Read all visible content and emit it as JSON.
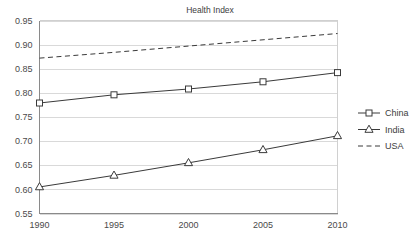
{
  "chart_data": {
    "type": "line",
    "title": "Health Index",
    "xlabel": "",
    "ylabel": "",
    "x": [
      1990,
      1995,
      2000,
      2005,
      2010
    ],
    "categories": [
      "1990",
      "1995",
      "2000",
      "2005",
      "2010"
    ],
    "xtick_labels": [
      "1990",
      "1995",
      "2000",
      "2005",
      "2010"
    ],
    "ytick_labels": [
      "0.55",
      "0.60",
      "0.65",
      "0.70",
      "0.75",
      "0.80",
      "0.85",
      "0.90",
      "0.95"
    ],
    "ytick_values": [
      0.55,
      0.6,
      0.65,
      0.7,
      0.75,
      0.8,
      0.85,
      0.9,
      0.95
    ],
    "ylim": [
      0.55,
      0.95
    ],
    "xlim": [
      1990,
      2010
    ],
    "grid": "horizontal",
    "legend_position": "right",
    "series": [
      {
        "name": "China",
        "values": [
          0.779,
          0.796,
          0.808,
          0.823,
          0.842
        ],
        "marker": "square",
        "line_style": "solid",
        "color": "#3a3a3a"
      },
      {
        "name": "India",
        "values": [
          0.605,
          0.629,
          0.655,
          0.682,
          0.711
        ],
        "marker": "triangle",
        "line_style": "solid",
        "color": "#3a3a3a"
      },
      {
        "name": "USA",
        "values": [
          0.872,
          0.884,
          0.897,
          0.91,
          0.923
        ],
        "marker": "none",
        "line_style": "dashed",
        "color": "#3a3a3a"
      }
    ]
  },
  "legend": {
    "items": [
      {
        "label": "China"
      },
      {
        "label": "India"
      },
      {
        "label": "USA"
      }
    ]
  },
  "colors": {
    "background": "#ffffff",
    "ink": "#3a3a3a",
    "grid": "#d9d9d9",
    "axis": "#8a8a8a"
  }
}
